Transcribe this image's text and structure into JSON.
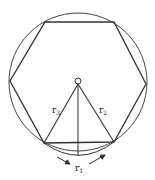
{
  "diagram": {
    "labels": {
      "left_radius": "r",
      "left_radius_sub": "3",
      "right_radius": "r",
      "right_radius_sub": "2",
      "bottom_arc": "r",
      "bottom_arc_sub": "1"
    },
    "colors": {
      "stroke": "#333333",
      "background": "#ffffff"
    }
  }
}
